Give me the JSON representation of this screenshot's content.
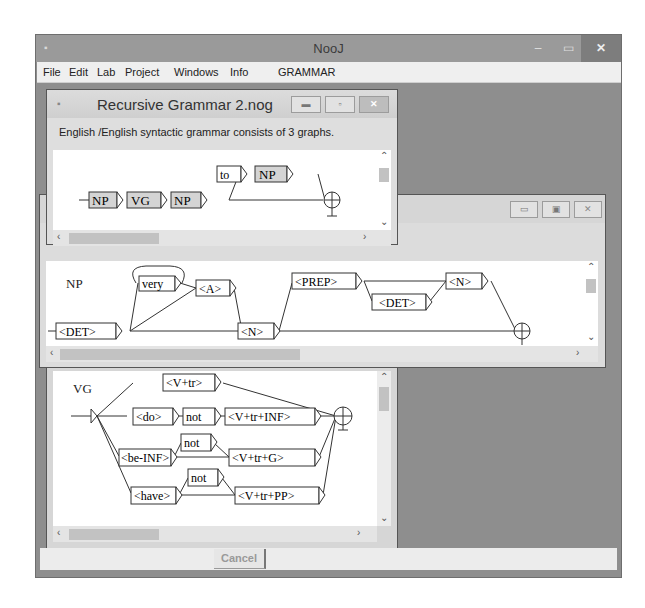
{
  "app": {
    "title": "NooJ",
    "controls": {
      "minimize": "–",
      "maximize": "▭",
      "close": "✕"
    }
  },
  "menu": {
    "items": [
      "File",
      "Edit",
      "Lab",
      "Project",
      "Windows",
      "Info",
      "GRAMMAR"
    ]
  },
  "grammar_window": {
    "title": "Recursive Grammar 2.nog",
    "info": "English /English  syntactic grammar consists of 3 graphs.",
    "graph": {
      "nodes": [
        "NP",
        "VG",
        "NP",
        "to",
        "NP"
      ]
    }
  },
  "np_window": {
    "graph_name": "NP",
    "nodes": [
      "<DET>",
      "very",
      "<A>",
      "<N>",
      "<PREP>",
      "<DET>",
      "<N>"
    ]
  },
  "vg_window": {
    "graph_name": "VG",
    "nodes": [
      "<V+tr>",
      "<do>",
      "not",
      "<V+tr+INF>",
      "<be-INF>",
      "not",
      "<V+tr+G>",
      "<have>",
      "not",
      "<V+tr+PP>"
    ]
  },
  "status": {
    "cancel_label": "Cancel"
  }
}
